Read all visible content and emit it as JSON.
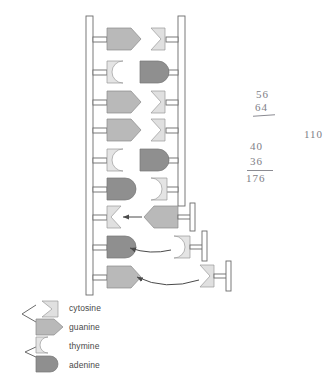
{
  "figure": {
    "type": "diagram"
  },
  "colors": {
    "cytosine": "#e0e0e0",
    "guanine": "#b9b9b9",
    "thymine": "#e4e4e4",
    "adenine": "#8f8f8f",
    "stroke": "#6b6b6b",
    "backbone": "#555555",
    "arrow": "#4a4a4a",
    "handwriting": "#7e7e86",
    "text": "#4a4a4a",
    "background": "#ffffff"
  },
  "legend": {
    "items": [
      {
        "label": "cytosine",
        "shape": "notched-wedge",
        "fill": "#e0e0e0"
      },
      {
        "label": "guanine",
        "shape": "pentagon-arrow",
        "fill": "#b9b9b9"
      },
      {
        "label": "thymine",
        "shape": "concave-block",
        "fill": "#e4e4e4"
      },
      {
        "label": "adenine",
        "shape": "rounded-block",
        "fill": "#8f8f8f"
      }
    ]
  },
  "ladder": {
    "rungs": [
      {
        "left_base": "guanine",
        "right_base": "cytosine",
        "paired": true
      },
      {
        "left_base": "thymine",
        "right_base": "adenine",
        "paired": true
      },
      {
        "left_base": "guanine",
        "right_base": "cytosine",
        "paired": true
      },
      {
        "left_base": "guanine",
        "right_base": "cytosine",
        "paired": true
      },
      {
        "left_base": "thymine",
        "right_base": "adenine",
        "paired": true
      },
      {
        "left_base": "adenine",
        "right_base": "thymine",
        "paired": true
      },
      {
        "left_base": "cytosine",
        "right_base": null,
        "paired": false
      },
      {
        "left_base": "adenine",
        "right_base": null,
        "paired": false
      },
      {
        "left_base": "guanine",
        "right_base": null,
        "paired": false
      }
    ]
  },
  "free_nucleotides": [
    {
      "base": "guanine",
      "target_rung": 7,
      "has_phosphate_tail": true
    },
    {
      "base": "thymine",
      "target_rung": 8,
      "has_phosphate_tail": true
    },
    {
      "base": "cytosine",
      "target_rung": 9,
      "has_phosphate_tail": true
    }
  ],
  "annotations": {
    "note_top": {
      "line1": "56",
      "line2": "64",
      "underlined": true
    },
    "note_right": {
      "value": "110"
    },
    "note_bottom": {
      "line1": "40",
      "line2": "36",
      "line3": "176",
      "underlined": true
    }
  }
}
